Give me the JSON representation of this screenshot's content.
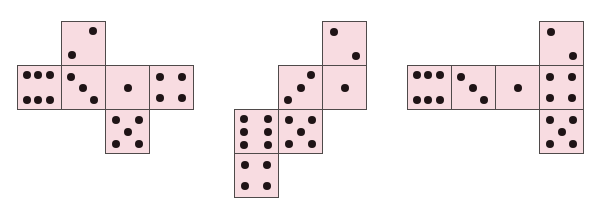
{
  "figure": {
    "background": "#ffffff",
    "width": 592,
    "height": 215
  },
  "style": {
    "face_fill": "#f8dce1",
    "face_border": "#4f4a4a",
    "pip_color": "#1f1416",
    "face_size": 45,
    "pip_size": 8
  },
  "pip_layouts": {
    "one": [
      [
        50,
        50
      ]
    ],
    "two_ascending": [
      [
        73,
        21
      ],
      [
        23,
        77
      ]
    ],
    "two_descending": [
      [
        25,
        23
      ],
      [
        76,
        78
      ]
    ],
    "three_descending": [
      [
        21,
        25
      ],
      [
        48,
        52
      ],
      [
        75,
        80
      ]
    ],
    "three_ascending": [
      [
        75,
        20
      ],
      [
        50,
        51
      ],
      [
        22,
        78
      ]
    ],
    "four": [
      [
        23,
        25
      ],
      [
        75,
        25
      ],
      [
        23,
        75
      ],
      [
        75,
        75
      ]
    ],
    "five": [
      [
        23,
        24
      ],
      [
        76,
        24
      ],
      [
        50,
        52
      ],
      [
        23,
        79
      ],
      [
        76,
        79
      ]
    ],
    "six_horizontal": [
      [
        21,
        22
      ],
      [
        47,
        22
      ],
      [
        74,
        22
      ],
      [
        21,
        78
      ],
      [
        47,
        78
      ],
      [
        74,
        78
      ]
    ],
    "six_vertical": [
      [
        22,
        21
      ],
      [
        77,
        21
      ],
      [
        22,
        51
      ],
      [
        77,
        51
      ],
      [
        22,
        81
      ],
      [
        77,
        81
      ]
    ]
  },
  "nets": [
    {
      "name": "cube-net-1",
      "faces": [
        {
          "value": 2,
          "layout": "two_ascending",
          "x": 61,
          "y": 21
        },
        {
          "value": 6,
          "layout": "six_horizontal",
          "x": 17,
          "y": 65
        },
        {
          "value": 3,
          "layout": "three_descending",
          "x": 61,
          "y": 65
        },
        {
          "value": 1,
          "layout": "one",
          "x": 105,
          "y": 65
        },
        {
          "value": 4,
          "layout": "four",
          "x": 149,
          "y": 65
        },
        {
          "value": 5,
          "layout": "five",
          "x": 105,
          "y": 109
        }
      ]
    },
    {
      "name": "cube-net-2",
      "faces": [
        {
          "value": 2,
          "layout": "two_descending",
          "x": 322,
          "y": 21
        },
        {
          "value": 3,
          "layout": "three_ascending",
          "x": 278,
          "y": 65
        },
        {
          "value": 1,
          "layout": "one",
          "x": 322,
          "y": 65
        },
        {
          "value": 6,
          "layout": "six_vertical",
          "x": 234,
          "y": 109
        },
        {
          "value": 5,
          "layout": "five",
          "x": 278,
          "y": 109
        },
        {
          "value": 4,
          "layout": "four",
          "x": 234,
          "y": 153
        }
      ]
    },
    {
      "name": "cube-net-3",
      "faces": [
        {
          "value": 2,
          "layout": "two_descending",
          "x": 539,
          "y": 21
        },
        {
          "value": 6,
          "layout": "six_horizontal",
          "x": 407,
          "y": 65
        },
        {
          "value": 3,
          "layout": "three_descending",
          "x": 451,
          "y": 65
        },
        {
          "value": 1,
          "layout": "one",
          "x": 495,
          "y": 65
        },
        {
          "value": 4,
          "layout": "four",
          "x": 539,
          "y": 65
        },
        {
          "value": 5,
          "layout": "five",
          "x": 539,
          "y": 109
        }
      ]
    }
  ]
}
